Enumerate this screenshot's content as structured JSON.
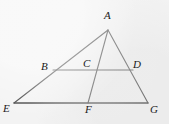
{
  "figure": {
    "kind": "geometry-diagram",
    "background_color": "#f3f3f3",
    "stroke_color": "#3a3a3a",
    "label_color": "#1a1a1a",
    "canvas": {
      "width": 169,
      "height": 124
    },
    "points": [
      {
        "id": "A",
        "label": "A",
        "x": 108,
        "y": 30,
        "label_x": 104,
        "label_y": 10
      },
      {
        "id": "B",
        "label": "B",
        "x": 53,
        "y": 70,
        "label_x": 41,
        "label_y": 61
      },
      {
        "id": "C",
        "label": "C",
        "x": 95,
        "y": 70,
        "label_x": 83,
        "label_y": 58
      },
      {
        "id": "D",
        "label": "D",
        "x": 133,
        "y": 70,
        "label_x": 133,
        "label_y": 59
      },
      {
        "id": "E",
        "label": "E",
        "x": 14,
        "y": 103,
        "label_x": 3,
        "label_y": 103
      },
      {
        "id": "F",
        "label": "F",
        "x": 88,
        "y": 103,
        "label_x": 85,
        "label_y": 104
      },
      {
        "id": "G",
        "label": "G",
        "x": 148,
        "y": 103,
        "label_x": 150,
        "label_y": 104
      }
    ],
    "segments": [
      {
        "id": "AE",
        "from": "A",
        "to": "E",
        "x1": 108,
        "y1": 30,
        "x2": 14,
        "y2": 103
      },
      {
        "id": "AG",
        "from": "A",
        "to": "G",
        "x1": 108,
        "y1": 30,
        "x2": 148,
        "y2": 103
      },
      {
        "id": "EG",
        "from": "E",
        "to": "G",
        "x1": 14,
        "y1": 103,
        "x2": 148,
        "y2": 103
      },
      {
        "id": "AF",
        "from": "A",
        "to": "F",
        "x1": 108,
        "y1": 30,
        "x2": 88,
        "y2": 103
      },
      {
        "id": "BD",
        "from": "B",
        "to": "D",
        "x1": 53,
        "y1": 70,
        "x2": 133,
        "y2": 70
      }
    ]
  }
}
